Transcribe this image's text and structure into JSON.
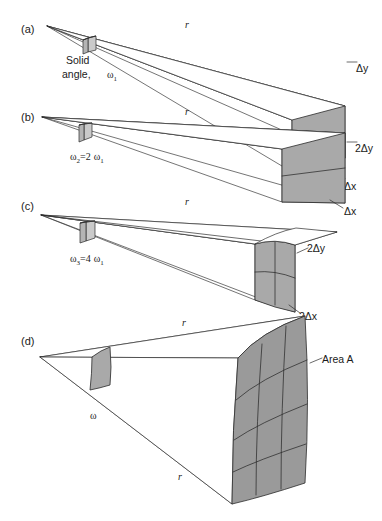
{
  "figure": {
    "background_color": "#ffffff",
    "line_color": "#2b2b2b",
    "shade_color": "#a9a9a9"
  },
  "panels": [
    {
      "id": "a",
      "label": "(a)",
      "radius_label": "r",
      "solid_angle_caption_line1": "Solid",
      "solid_angle_caption_line2": "angle,",
      "omega_symbol": "ω",
      "omega_subscript": "1",
      "height_label": "Δy",
      "width_label": "Δx",
      "columns": 1,
      "rows": 1
    },
    {
      "id": "b",
      "label": "(b)",
      "radius_label": "r",
      "omega_symbol": "ω",
      "omega_subscript": "2",
      "relation": "=2",
      "relation_omega": "ω",
      "relation_subscript": "1",
      "height_label": "2Δy",
      "width_label": "Δx",
      "columns": 1,
      "rows": 2
    },
    {
      "id": "c",
      "label": "(c)",
      "radius_label": "r",
      "omega_symbol": "ω",
      "omega_subscript": "3",
      "relation": "=4",
      "relation_omega": "ω",
      "relation_subscript": "1",
      "height_label": "2Δy",
      "width_label": "2Δx",
      "columns": 2,
      "rows": 2
    },
    {
      "id": "d",
      "label": "(d)",
      "radius_label_top": "r",
      "radius_label_bottom": "r",
      "omega_symbol": "ω",
      "area_label": "Area A",
      "columns": 3,
      "rows": 4
    }
  ]
}
